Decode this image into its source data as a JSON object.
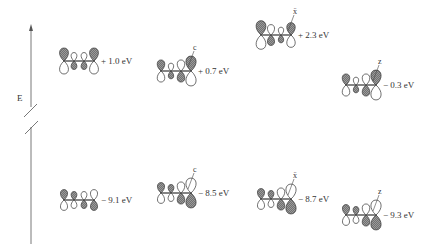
{
  "axis": {
    "label": "E",
    "broken": true
  },
  "colors": {
    "line": "#444444",
    "shaded": "#8a8a8a",
    "open": "#ffffff"
  },
  "orbitals": [
    {
      "id": "butadiene-lumo",
      "system": "C=C-C=C",
      "substituent": "",
      "energy_label": "+ 1.0 eV",
      "level": "upper",
      "x": 60,
      "y": 61,
      "lobes": [
        {
          "top": "shaded",
          "top_size": 1.0,
          "bottom_size": 1.0
        },
        {
          "top": "open",
          "top_size": 0.65,
          "bottom_size": 0.65
        },
        {
          "top": "open",
          "top_size": 0.65,
          "bottom_size": 0.65
        },
        {
          "top": "shaded",
          "top_size": 1.0,
          "bottom_size": 1.0
        }
      ]
    },
    {
      "id": "c-substituted-lumo",
      "system": "C-substituted",
      "substituent": "c",
      "energy_label": "+ 0.7 eV",
      "level": "upper",
      "x": 157,
      "y": 71,
      "lobes": [
        {
          "top": "shaded",
          "top_size": 0.85,
          "bottom_size": 0.85
        },
        {
          "top": "open",
          "top_size": 0.6,
          "bottom_size": 0.6
        },
        {
          "top": "open",
          "top_size": 0.85,
          "bottom_size": 0.85
        },
        {
          "top": "shaded",
          "top_size": 1.15,
          "bottom_size": 1.15
        }
      ]
    },
    {
      "id": "x-substituted-lumo",
      "system": "X-substituted",
      "substituent": "ẍ",
      "energy_label": "+ 2.3 eV",
      "level": "upper",
      "x": 257,
      "y": 35,
      "lobes": [
        {
          "top": "shaded",
          "top_size": 1.1,
          "bottom_size": 1.1
        },
        {
          "top": "open",
          "top_size": 0.8,
          "bottom_size": 0.8
        },
        {
          "top": "open",
          "top_size": 0.6,
          "bottom_size": 0.6
        },
        {
          "top": "shaded",
          "top_size": 0.95,
          "bottom_size": 0.95
        }
      ]
    },
    {
      "id": "z-substituted-lumo",
      "system": "Z-substituted",
      "substituent": "z",
      "energy_label": "− 0.3 eV",
      "level": "upper",
      "x": 342,
      "y": 85,
      "lobes": [
        {
          "top": "shaded",
          "top_size": 0.85,
          "bottom_size": 0.85
        },
        {
          "top": "open",
          "top_size": 0.6,
          "bottom_size": 0.6
        },
        {
          "top": "open",
          "top_size": 0.85,
          "bottom_size": 0.85
        },
        {
          "top": "shaded",
          "top_size": 1.15,
          "bottom_size": 1.15
        }
      ]
    },
    {
      "id": "butadiene-homo",
      "system": "C=C-C=C",
      "substituent": "",
      "energy_label": "− 9.1 eV",
      "level": "lower",
      "x": 60,
      "y": 200,
      "lobes": [
        {
          "top": "shaded",
          "top_size": 0.8,
          "bottom_size": 0.8
        },
        {
          "top": "shaded",
          "top_size": 0.65,
          "bottom_size": 0.65
        },
        {
          "top": "open",
          "top_size": 0.65,
          "bottom_size": 0.65
        },
        {
          "top": "open",
          "top_size": 0.8,
          "bottom_size": 0.8
        }
      ]
    },
    {
      "id": "c-substituted-homo",
      "system": "C-substituted",
      "substituent": "c",
      "energy_label": "− 8.5 eV",
      "level": "lower",
      "x": 157,
      "y": 193,
      "lobes": [
        {
          "top": "shaded",
          "top_size": 0.8,
          "bottom_size": 0.8
        },
        {
          "top": "shaded",
          "top_size": 0.65,
          "bottom_size": 0.65
        },
        {
          "top": "open",
          "top_size": 0.85,
          "bottom_size": 0.85
        },
        {
          "top": "open",
          "top_size": 1.15,
          "bottom_size": 1.15
        }
      ]
    },
    {
      "id": "x-substituted-homo",
      "system": "X-substituted",
      "substituent": "ẍ",
      "energy_label": "− 8.7 eV",
      "level": "lower",
      "x": 257,
      "y": 199,
      "lobes": [
        {
          "top": "shaded",
          "top_size": 0.8,
          "bottom_size": 0.8
        },
        {
          "top": "shaded",
          "top_size": 0.65,
          "bottom_size": 0.65
        },
        {
          "top": "open",
          "top_size": 0.85,
          "bottom_size": 0.85
        },
        {
          "top": "open",
          "top_size": 1.15,
          "bottom_size": 1.15
        }
      ]
    },
    {
      "id": "z-substituted-homo",
      "system": "Z-substituted",
      "substituent": "z",
      "energy_label": "− 9.3 eV",
      "level": "lower",
      "x": 342,
      "y": 215,
      "lobes": [
        {
          "top": "shaded",
          "top_size": 0.8,
          "bottom_size": 0.8
        },
        {
          "top": "shaded",
          "top_size": 0.65,
          "bottom_size": 0.65
        },
        {
          "top": "open",
          "top_size": 0.85,
          "bottom_size": 0.85
        },
        {
          "top": "open",
          "top_size": 1.15,
          "bottom_size": 1.15
        }
      ]
    }
  ]
}
